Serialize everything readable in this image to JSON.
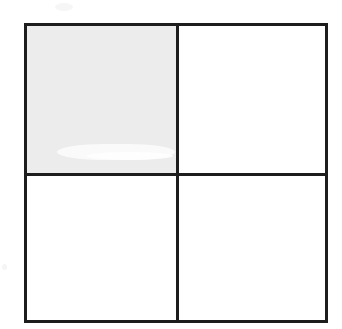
{
  "figure": {
    "name": "square-divided-into-quarters",
    "outline_color": "#1d1d1d",
    "shaded_color": "#ececec",
    "unshaded_color": "#ffffff",
    "background_color": "#ffffff",
    "rows": 2,
    "columns": 2,
    "total_parts": 4,
    "shaded_parts": 1,
    "fraction_shaded": "1/4",
    "quadrants": [
      {
        "position": "top-left",
        "shaded": true,
        "label": ""
      },
      {
        "position": "top-right",
        "shaded": false,
        "label": ""
      },
      {
        "position": "bottom-left",
        "shaded": false,
        "label": ""
      },
      {
        "position": "bottom-right",
        "shaded": false,
        "label": ""
      }
    ]
  },
  "chart_data": {
    "type": "table",
    "title": "",
    "xlabel": "",
    "ylabel": "",
    "categories": [
      "top-left",
      "top-right",
      "bottom-left",
      "bottom-right"
    ],
    "values": [
      1,
      0,
      0,
      0
    ],
    "legend": [],
    "grid": true
  }
}
